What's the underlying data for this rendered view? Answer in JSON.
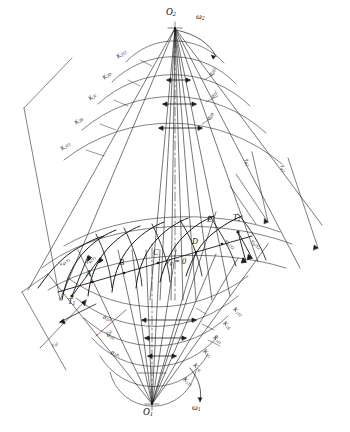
{
  "figure": {
    "type": "engineering-kinematic-diagram",
    "background": "#ffffff",
    "line_color": "#1a1a1a"
  },
  "centers": {
    "upper": {
      "label": "O",
      "sub": "2",
      "omega": "ω",
      "omega_sub": "2"
    },
    "lower": {
      "label": "O",
      "sub": "1",
      "omega": "ω",
      "omega_sub": "1"
    }
  },
  "contact_points": [
    {
      "name": "A"
    },
    {
      "name": "B"
    },
    {
      "name": "C"
    },
    {
      "name": "D"
    },
    {
      "name": "E"
    }
  ],
  "tangent_points": [
    {
      "label": "T",
      "sub": "1"
    },
    {
      "label": "T",
      "sub": "2"
    }
  ],
  "zero_velocity": {
    "text": "v",
    "sub": "g",
    "eq": " = 0"
  },
  "upper_arc_labels": [
    {
      "text": "K",
      "sub": "2T2"
    },
    {
      "text": "K",
      "sub": "2D"
    },
    {
      "text": "K",
      "sub": "2C"
    },
    {
      "text": "K",
      "sub": "2B"
    },
    {
      "text": "K",
      "sub": "2T1"
    }
  ],
  "upper_angle_labels": [
    {
      "text": "α",
      "sub": "2D"
    },
    {
      "text": "α",
      "sub": "2C"
    },
    {
      "text": "α",
      "sub": "2B"
    }
  ],
  "lower_arc_labels": [
    {
      "text": "K",
      "sub": "1T2"
    },
    {
      "text": "K",
      "sub": "1E"
    },
    {
      "text": "K",
      "sub": "1D"
    },
    {
      "text": "K",
      "sub": "1C"
    },
    {
      "text": "K",
      "sub": "1B"
    },
    {
      "text": "K",
      "sub": "1T1"
    }
  ],
  "lower_angle_labels": [
    {
      "text": "α",
      "sub": "1D"
    },
    {
      "text": "α",
      "sub": "1C"
    },
    {
      "text": "α",
      "sub": "1B"
    }
  ],
  "velocity_labels": [
    {
      "text": "v",
      "sub": "g1T1"
    },
    {
      "text": "v",
      "sub": "g2T1"
    },
    {
      "text": "v",
      "sub": "g1T2"
    },
    {
      "text": "v",
      "sub": "g2T2"
    }
  ],
  "radius_labels": [
    {
      "text": "r",
      "sub": "b2"
    },
    {
      "text": "r",
      "sub": "a2"
    },
    {
      "text": "r",
      "sub": "b1"
    },
    {
      "text": "r",
      "sub": "a1"
    }
  ]
}
